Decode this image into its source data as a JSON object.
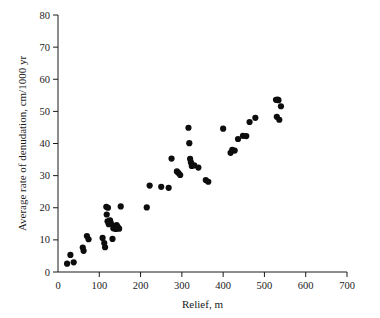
{
  "chart_data": {
    "type": "scatter",
    "title": "",
    "xlabel": "Relief, m",
    "ylabel": "Average rate of denudation, cm/1000 yr",
    "xlim": [
      0,
      700
    ],
    "ylim": [
      0,
      80
    ],
    "xticks": [
      0,
      100,
      200,
      300,
      400,
      500,
      600,
      700
    ],
    "yticks": [
      0,
      10,
      20,
      30,
      40,
      50,
      60,
      70,
      80
    ],
    "xtick_labels": [
      "0",
      "100",
      "200",
      "300",
      "400",
      "500",
      "600",
      "700"
    ],
    "ytick_labels": [
      "0",
      "10",
      "20",
      "30",
      "40",
      "50",
      "60",
      "70",
      "80"
    ],
    "grid": false,
    "legend": null,
    "marker": "filled-circle",
    "marker_color": "#0d0d0d",
    "marker_size": 3.1,
    "n_points": 62,
    "points": [
      [
        22,
        2.6
      ],
      [
        30,
        5.3
      ],
      [
        38,
        3.0
      ],
      [
        60,
        7.6
      ],
      [
        62,
        6.6
      ],
      [
        70,
        11.2
      ],
      [
        74,
        10.2
      ],
      [
        108,
        10.6
      ],
      [
        112,
        9.0
      ],
      [
        114,
        7.7
      ],
      [
        117,
        20.3
      ],
      [
        118,
        17.9
      ],
      [
        120,
        15.8
      ],
      [
        121,
        20.0
      ],
      [
        123,
        14.9
      ],
      [
        126,
        16.1
      ],
      [
        128,
        15.2
      ],
      [
        132,
        10.3
      ],
      [
        134,
        13.6
      ],
      [
        138,
        14.2
      ],
      [
        140,
        13.4
      ],
      [
        142,
        14.6
      ],
      [
        143,
        13.9
      ],
      [
        145,
        14.0
      ],
      [
        148,
        13.5
      ],
      [
        152,
        20.4
      ],
      [
        215,
        20.1
      ],
      [
        222,
        26.9
      ],
      [
        250,
        26.5
      ],
      [
        268,
        26.2
      ],
      [
        275,
        35.3
      ],
      [
        288,
        31.3
      ],
      [
        292,
        30.8
      ],
      [
        296,
        30.2
      ],
      [
        316,
        44.9
      ],
      [
        318,
        40.1
      ],
      [
        320,
        35.2
      ],
      [
        322,
        34.1
      ],
      [
        324,
        33.0
      ],
      [
        330,
        33.2
      ],
      [
        340,
        32.5
      ],
      [
        358,
        28.6
      ],
      [
        364,
        28.1
      ],
      [
        400,
        44.6
      ],
      [
        418,
        37.1
      ],
      [
        422,
        38.0
      ],
      [
        428,
        37.8
      ],
      [
        436,
        41.4
      ],
      [
        448,
        42.4
      ],
      [
        456,
        42.3
      ],
      [
        464,
        46.7
      ],
      [
        478,
        48.0
      ],
      [
        528,
        53.6
      ],
      [
        530,
        48.3
      ],
      [
        532,
        53.7
      ],
      [
        534,
        53.5
      ],
      [
        536,
        47.4
      ],
      [
        540,
        51.6
      ]
    ]
  }
}
